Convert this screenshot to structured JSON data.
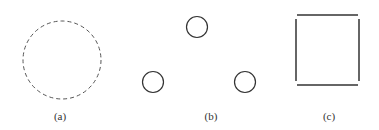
{
  "figures": [
    {
      "id": "a",
      "label": "(a)",
      "description": "dashed circle"
    },
    {
      "id": "b",
      "label": "(b)",
      "description": "three small circles in triangle arrangement"
    },
    {
      "id": "c",
      "label": "(c)",
      "description": "square made of four separate line segments"
    }
  ],
  "colors": {
    "stroke": "#333333",
    "background": "#ffffff"
  }
}
